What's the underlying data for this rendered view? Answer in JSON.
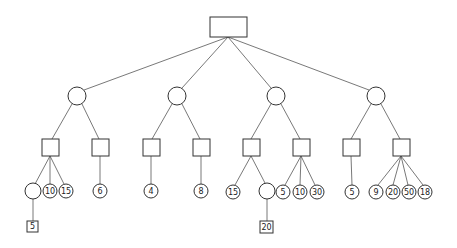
{
  "diagram": {
    "type": "game-tree",
    "root": {
      "shape": "rect"
    },
    "level1": [
      {
        "shape": "circle",
        "children": [
          {
            "shape": "square",
            "children": [
              {
                "shape": "circle",
                "label": "",
                "children": [
                  {
                    "shape": "square",
                    "label": "5"
                  }
                ]
              },
              {
                "shape": "circle",
                "label": "10"
              },
              {
                "shape": "circle",
                "label": "15"
              }
            ]
          },
          {
            "shape": "square",
            "children": [
              {
                "shape": "circle",
                "label": "6"
              }
            ]
          }
        ]
      },
      {
        "shape": "circle",
        "children": [
          {
            "shape": "square",
            "children": [
              {
                "shape": "circle",
                "label": "4"
              }
            ]
          },
          {
            "shape": "square",
            "children": [
              {
                "shape": "circle",
                "label": "8"
              }
            ]
          }
        ]
      },
      {
        "shape": "circle",
        "children": [
          {
            "shape": "square",
            "children": [
              {
                "shape": "circle",
                "label": "15"
              },
              {
                "shape": "circle",
                "label": "",
                "children": [
                  {
                    "shape": "square",
                    "label": "20"
                  }
                ]
              }
            ]
          },
          {
            "shape": "square",
            "children": [
              {
                "shape": "circle",
                "label": "5"
              },
              {
                "shape": "circle",
                "label": "10"
              },
              {
                "shape": "circle",
                "label": "30"
              }
            ]
          }
        ]
      },
      {
        "shape": "circle",
        "children": [
          {
            "shape": "square",
            "children": [
              {
                "shape": "circle",
                "label": "5"
              }
            ]
          },
          {
            "shape": "square",
            "children": [
              {
                "shape": "circle",
                "label": "9"
              },
              {
                "shape": "circle",
                "label": "20"
              },
              {
                "shape": "circle",
                "label": "50"
              },
              {
                "shape": "circle",
                "label": "18"
              }
            ]
          }
        ]
      }
    ]
  },
  "labels": {
    "l1": "10",
    "l2": "15",
    "l3": "6",
    "l4": "4",
    "l5": "8",
    "l6": "15",
    "l7": "5",
    "l8": "10",
    "l9": "30",
    "l10": "5",
    "l11": "9",
    "l12": "20",
    "l13": "50",
    "l14": "18",
    "b1": "5",
    "b2": "20"
  }
}
